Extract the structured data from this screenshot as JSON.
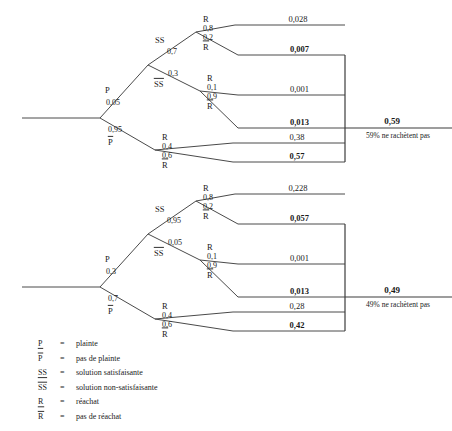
{
  "diagram": {
    "root_label_line1": "Clients",
    "root_label_line2": "insatisfaits",
    "colors": {
      "line": "#4a4a4a",
      "text": "#1a1a1a",
      "background": "#ffffff"
    }
  },
  "trees": [
    {
      "id": "tree-top",
      "root_line1": "Clients",
      "root_line2": "insatisfaits",
      "final_value": "0,59",
      "final_note": "59% ne rachètent pas",
      "branches": {
        "p_label": "P",
        "p_prob": "0,05",
        "pbar_label": "P",
        "pbar_prob": "0,95",
        "ss_label": "SS",
        "ss_prob": "0,7",
        "ssbar_label": "SS",
        "ssbar_prob": "0,3"
      },
      "leaves": [
        {
          "node": "R",
          "prob": "0,8",
          "value": "0,028",
          "bold": false
        },
        {
          "node": "R",
          "prob": "0,2",
          "value": "0,007",
          "bold": true
        },
        {
          "node": "R",
          "prob": "0,1",
          "value": "0,001",
          "bold": false
        },
        {
          "node": "R",
          "prob": "0,9",
          "value": "0,013",
          "bold": true
        },
        {
          "node": "R",
          "prob": "0,4",
          "value": "0,38",
          "bold": false
        },
        {
          "node": "R",
          "prob": "0,6",
          "value": "0,57",
          "bold": true
        }
      ]
    },
    {
      "id": "tree-bottom",
      "root_line1": "Clients",
      "root_line2": "insatisfaits",
      "final_value": "0,49",
      "final_note": "49% ne rachètent pas",
      "branches": {
        "p_label": "P",
        "p_prob": "0,3",
        "pbar_label": "P",
        "pbar_prob": "0,7",
        "ss_label": "SS",
        "ss_prob": "0,95",
        "ssbar_label": "SS",
        "ssbar_prob": "0,05"
      },
      "leaves": [
        {
          "node": "R",
          "prob": "0,8",
          "value": "0,228",
          "bold": false
        },
        {
          "node": "R",
          "prob": "0,2",
          "value": "0,057",
          "bold": true
        },
        {
          "node": "R",
          "prob": "0,1",
          "value": "0,001",
          "bold": false
        },
        {
          "node": "R",
          "prob": "0,9",
          "value": "0,013",
          "bold": true
        },
        {
          "node": "R",
          "prob": "0,4",
          "value": "0,28",
          "bold": false
        },
        {
          "node": "R",
          "prob": "0,6",
          "value": "0,42",
          "bold": true
        }
      ]
    }
  ],
  "legend": {
    "rows": [
      {
        "symbol": "P",
        "bar": false,
        "eq": "=",
        "text": "plainte"
      },
      {
        "symbol": "P",
        "bar": true,
        "eq": "=",
        "text": "pas de plainte"
      },
      {
        "symbol": "SS",
        "bar": false,
        "eq": "=",
        "text": "solution satisfaisante"
      },
      {
        "symbol": "SS",
        "bar": true,
        "eq": "=",
        "text": "solution non-satisfaisante"
      },
      {
        "symbol": "R",
        "bar": false,
        "eq": "=",
        "text": "réachat"
      },
      {
        "symbol": "R",
        "bar": true,
        "eq": "=",
        "text": "pas de réachat"
      }
    ]
  }
}
